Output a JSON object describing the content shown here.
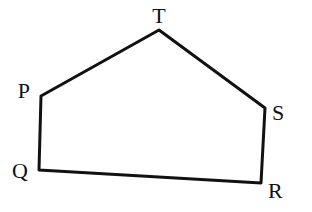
{
  "diagram": {
    "type": "pentagon",
    "stroke_color": "#111111",
    "background": "#ffffff",
    "vertices": [
      {
        "name": "T",
        "x": 159,
        "y": 30,
        "label_x": 159,
        "label_y": 23,
        "anchor": "middle"
      },
      {
        "name": "S",
        "x": 265,
        "y": 108,
        "label_x": 272,
        "label_y": 120,
        "anchor": "start"
      },
      {
        "name": "R",
        "x": 261,
        "y": 183,
        "label_x": 268,
        "label_y": 198,
        "anchor": "start"
      },
      {
        "name": "Q",
        "x": 39,
        "y": 170,
        "label_x": 28,
        "label_y": 178,
        "anchor": "end"
      },
      {
        "name": "P",
        "x": 41,
        "y": 96,
        "label_x": 30,
        "label_y": 98,
        "anchor": "end"
      }
    ],
    "edges": [
      [
        "T",
        "S"
      ],
      [
        "S",
        "R"
      ],
      [
        "R",
        "Q"
      ],
      [
        "Q",
        "P"
      ],
      [
        "P",
        "T"
      ]
    ],
    "labels": {
      "T": "T",
      "S": "S",
      "R": "R",
      "Q": "Q",
      "P": "P"
    }
  }
}
